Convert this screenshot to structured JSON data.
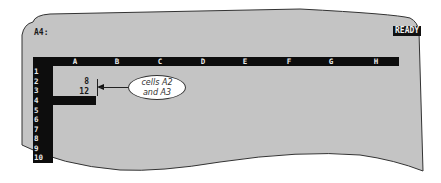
{
  "status_line": {
    "cell_reference": "A4:",
    "mode_indicator": "READY"
  },
  "worksheet": {
    "columns": [
      "A",
      "B",
      "C",
      "D",
      "E",
      "F",
      "G",
      "H"
    ],
    "rows": [
      "1",
      "2",
      "3",
      "4",
      "5",
      "6",
      "7",
      "8",
      "9",
      "10"
    ],
    "cells": {
      "A2": "8",
      "A3": "12"
    },
    "cell_pointer": "A4"
  },
  "annotation": {
    "line1": "cells A2",
    "line2": "and A3"
  },
  "colors": {
    "screen_background": "#c4c4c4",
    "header_bar": "#0d0d0d",
    "header_text": "#eaeaea"
  }
}
